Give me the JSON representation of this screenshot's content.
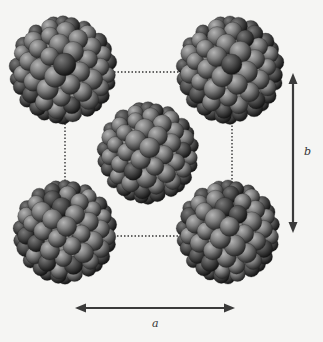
{
  "figure": {
    "labels": {
      "a": "a",
      "b": "b"
    },
    "colors": {
      "atom_light": "#9a9a9a",
      "atom_mid": "#6e6e6e",
      "atom_dark": "#2e2e2e",
      "arrow": "#3a3a3a",
      "dotted_cell": "#333333",
      "background": "#f5f5f3"
    },
    "molecules": [
      {
        "name": "top-left",
        "cx": 63,
        "cy": 70,
        "r": 52
      },
      {
        "name": "top-right",
        "cx": 230,
        "cy": 70,
        "r": 52
      },
      {
        "name": "center",
        "cx": 148,
        "cy": 153,
        "r": 49
      },
      {
        "name": "bottom-left",
        "cx": 65,
        "cy": 232,
        "r": 50
      },
      {
        "name": "bottom-right",
        "cx": 228,
        "cy": 232,
        "r": 50
      }
    ],
    "unit_cell": {
      "x1": 65,
      "y1": 72,
      "x2": 232,
      "y2": 236
    },
    "arrow_a": {
      "x1": 75,
      "x2": 235,
      "y": 308
    },
    "arrow_b": {
      "x": 293,
      "y1": 73,
      "y2": 233
    }
  }
}
